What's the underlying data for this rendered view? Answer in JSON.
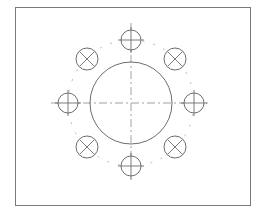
{
  "drawing": {
    "title": "",
    "frame": {
      "x": 15,
      "y": 7,
      "width": 235,
      "height": 198
    },
    "colors": {
      "line": "#6e6e6e",
      "center_line": "#8a8a8a",
      "background": "#ffffff"
    },
    "center": {
      "x": 131,
      "y": 103
    },
    "main_circle": {
      "radius": 41
    },
    "bolt_circle": {
      "radius": 63
    },
    "holes": [
      {
        "id": "hole-top",
        "cx": 131,
        "cy": 40,
        "r": 10,
        "mark": "cross"
      },
      {
        "id": "hole-right",
        "cx": 194,
        "cy": 103,
        "r": 10,
        "mark": "cross"
      },
      {
        "id": "hole-bottom",
        "cx": 131,
        "cy": 166,
        "r": 10,
        "mark": "cross"
      },
      {
        "id": "hole-left",
        "cx": 68,
        "cy": 103,
        "r": 10,
        "mark": "cross"
      },
      {
        "id": "hole-top-left",
        "cx": 87,
        "cy": 59,
        "r": 11,
        "mark": "x"
      },
      {
        "id": "hole-top-right",
        "cx": 175,
        "cy": 59,
        "r": 11,
        "mark": "x"
      },
      {
        "id": "hole-bottom-right",
        "cx": 175,
        "cy": 147,
        "r": 11,
        "mark": "x"
      },
      {
        "id": "hole-bottom-left",
        "cx": 87,
        "cy": 147,
        "r": 11,
        "mark": "x"
      }
    ]
  }
}
